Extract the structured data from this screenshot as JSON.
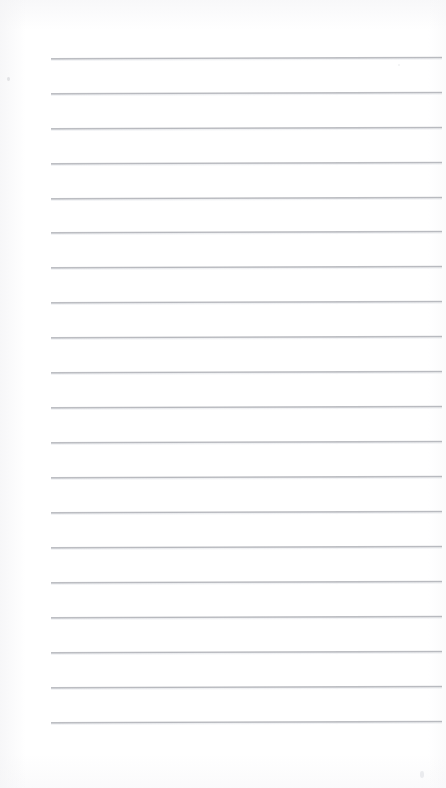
{
  "document": {
    "kind": "scanned-lined-notepad-page",
    "title": "Blank ruled notepad page",
    "page_width": 446,
    "page_height": 788,
    "background_color": "#ffffff",
    "paper_tint": "#fdfdfd",
    "has_text_content": false,
    "written_content": "",
    "margin_line": false,
    "holes": false
  },
  "ruling": {
    "line_color": "#b0b2b8",
    "line_count": 20,
    "line_thickness_px": 2,
    "line_left_px": 51,
    "line_right_px": 442,
    "line_width_px": 391,
    "first_line_y_px": 58,
    "line_spacing_px": 34.9,
    "skew_degrees": -0.19,
    "lines": [
      {
        "index": 1,
        "y": 58
      },
      {
        "index": 2,
        "y": 93
      },
      {
        "index": 3,
        "y": 128
      },
      {
        "index": 4,
        "y": 163
      },
      {
        "index": 5,
        "y": 198
      },
      {
        "index": 6,
        "y": 232
      },
      {
        "index": 7,
        "y": 267
      },
      {
        "index": 8,
        "y": 302
      },
      {
        "index": 9,
        "y": 337
      },
      {
        "index": 10,
        "y": 372
      },
      {
        "index": 11,
        "y": 407
      },
      {
        "index": 12,
        "y": 442
      },
      {
        "index": 13,
        "y": 477
      },
      {
        "index": 14,
        "y": 512
      },
      {
        "index": 15,
        "y": 547
      },
      {
        "index": 16,
        "y": 582
      },
      {
        "index": 17,
        "y": 617
      },
      {
        "index": 18,
        "y": 652
      },
      {
        "index": 19,
        "y": 687
      },
      {
        "index": 20,
        "y": 722
      }
    ]
  },
  "artifacts": [
    {
      "name": "speck-top-left",
      "x": 7,
      "y": 77,
      "color": "#ced0d4"
    },
    {
      "name": "speck-mid-right",
      "x": 398,
      "y": 64,
      "color": "#eeeff1"
    },
    {
      "name": "speck-bottom-right",
      "x": 420,
      "y": 771,
      "color": "#e8e9ec"
    }
  ]
}
